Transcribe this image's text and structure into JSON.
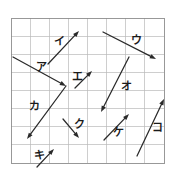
{
  "figure": {
    "background_color": "#ffffff",
    "grid": {
      "x0": 11,
      "y0": 18,
      "x1": 164,
      "y1": 163,
      "columns": 8,
      "rows": 8,
      "cell_width": 19.125,
      "cell_height": 18.125,
      "line_color": "#b9b9b9",
      "border_color": "#8d8d8d"
    },
    "vector_color": "#2a2a2a",
    "vectors": [
      {
        "label": "ア",
        "name": "vector-a",
        "tail_x": 13,
        "tail_y": 57,
        "tip_x": 66,
        "tip_y": 86,
        "label_x": 36,
        "label_y": 62,
        "dx_cells": 2.8,
        "dy_cells": 1.6,
        "direction": "right-down"
      },
      {
        "label": "イ",
        "name": "vector-i",
        "tail_x": 48,
        "tail_y": 64,
        "tip_x": 79,
        "tip_y": 31,
        "label_x": 54,
        "label_y": 36,
        "dx_cells": 1.6,
        "dy_cells": 1.8,
        "direction": "right-up"
      },
      {
        "label": "ウ",
        "name": "vector-u",
        "tail_x": 103,
        "tail_y": 32,
        "tip_x": 156,
        "tip_y": 59,
        "label_x": 131,
        "label_y": 35,
        "dx_cells": 2.8,
        "dy_cells": 1.5,
        "direction": "right-down"
      },
      {
        "label": "エ",
        "name": "vector-e",
        "tail_x": 75,
        "tail_y": 88,
        "tip_x": 92,
        "tip_y": 71,
        "label_x": 72,
        "label_y": 71,
        "dx_cells": 0.9,
        "dy_cells": 0.9,
        "direction": "right-up"
      },
      {
        "label": "オ",
        "name": "vector-o",
        "tail_x": 129,
        "tail_y": 57,
        "tip_x": 101,
        "tip_y": 112,
        "label_x": 121,
        "label_y": 81,
        "dx_cells": 1.5,
        "dy_cells": 3.0,
        "direction": "left-down"
      },
      {
        "label": "カ",
        "name": "vector-ka",
        "tail_x": 66,
        "tail_y": 86,
        "tip_x": 27,
        "tip_y": 139,
        "label_x": 29,
        "label_y": 101,
        "dx_cells": 2.0,
        "dy_cells": 2.9,
        "direction": "left-down"
      },
      {
        "label": "キ",
        "name": "vector-ki",
        "tail_x": 37,
        "tail_y": 167,
        "tip_x": 54,
        "tip_y": 149,
        "label_x": 34,
        "label_y": 150,
        "dx_cells": 0.9,
        "dy_cells": 1.0,
        "direction": "right-up"
      },
      {
        "label": "ク",
        "name": "vector-ku",
        "tail_x": 63,
        "tail_y": 119,
        "tip_x": 79,
        "tip_y": 138,
        "label_x": 74,
        "label_y": 119,
        "dx_cells": 0.8,
        "dy_cells": 1.0,
        "direction": "right-down"
      },
      {
        "label": "ケ",
        "name": "vector-ke",
        "tail_x": 104,
        "tail_y": 140,
        "tip_x": 129,
        "tip_y": 114,
        "label_x": 113,
        "label_y": 127,
        "dx_cells": 1.3,
        "dy_cells": 1.4,
        "direction": "right-up"
      },
      {
        "label": "コ",
        "name": "vector-ko",
        "tail_x": 137,
        "tail_y": 156,
        "tip_x": 164,
        "tip_y": 99,
        "label_x": 152,
        "label_y": 122,
        "dx_cells": 1.4,
        "dy_cells": 3.1,
        "direction": "right-up"
      }
    ]
  }
}
